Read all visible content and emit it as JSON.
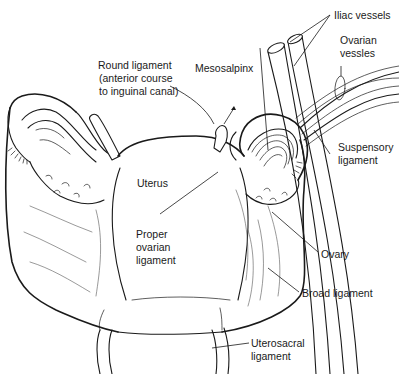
{
  "figure": {
    "line_color": "#1a1a1a",
    "background": "#ffffff"
  },
  "labels": {
    "iliac_vessels": "Iliac vessels",
    "ovarian_vessels_1": "Ovarian",
    "ovarian_vessels_2": "vessles",
    "round_ligament_1": "Round ligament",
    "round_ligament_2": "(anterior course",
    "round_ligament_3": "to inguinal canal)",
    "mesosalpinx": "Mesosalpinx",
    "suspensory_ligament_1": "Suspensory",
    "suspensory_ligament_2": "ligament",
    "uterus": "Uterus",
    "proper_ovarian_ligament_1": "Proper",
    "proper_ovarian_ligament_2": "ovarian",
    "proper_ovarian_ligament_3": "ligament",
    "ovary": "Ovary",
    "broad_ligament": "Broad ligament",
    "uterosacral_ligament_1": "Uterosacral",
    "uterosacral_ligament_2": "ligament"
  }
}
